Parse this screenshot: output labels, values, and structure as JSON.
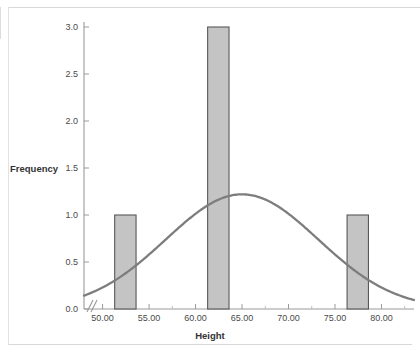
{
  "chart_data": {
    "type": "bar",
    "title": "",
    "subtitle": "",
    "xlabel": "Height",
    "ylabel": "Frequency",
    "xlim": [
      48.0,
      83.5
    ],
    "ylim": [
      0.0,
      3.1
    ],
    "grid": false,
    "legend": null,
    "axis_break": true,
    "x_ticks": [
      "50.00",
      "55.00",
      "60.00",
      "65.00",
      "70.00",
      "75.00",
      "80.00"
    ],
    "x_tick_values": [
      50,
      55,
      60,
      65,
      70,
      75,
      80
    ],
    "y_ticks": [
      "0.0",
      "0.5",
      "1.0",
      "1.5",
      "2.0",
      "2.5",
      "3.0"
    ],
    "y_tick_values": [
      0.0,
      0.5,
      1.0,
      1.5,
      2.0,
      2.5,
      3.0
    ],
    "bars": [
      {
        "label": "51.3-53.6",
        "x_start": 51.3,
        "x_end": 53.6,
        "value": 1
      },
      {
        "label": "61.3-63.6",
        "x_start": 61.3,
        "x_end": 63.6,
        "value": 3
      },
      {
        "label": "76.3-78.6",
        "x_start": 76.3,
        "x_end": 78.6,
        "value": 1
      }
    ],
    "values": [
      1,
      3,
      1
    ],
    "categories": [
      "51.3-53.6",
      "61.3-63.6",
      "76.3-78.6"
    ],
    "overlay_curve": {
      "name": "normal",
      "mean": 65.0,
      "std_dev": 8.2,
      "peak_value": 1.22,
      "left_end_value": 0.22,
      "right_end_value": 0.23
    },
    "colors": {
      "bar_fill": "#c4c4c4",
      "bar_border": "#58585a",
      "curve": "#7d7d7d",
      "axis": "#9a9a9a",
      "text": "#4a4a4a",
      "background": "#ffffff"
    }
  }
}
